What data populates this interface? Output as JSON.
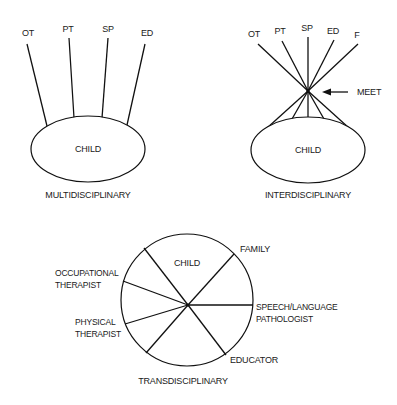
{
  "diagrams": {
    "multidisciplinary": {
      "title": "MULTIDISCIPLINARY",
      "center_label": "CHILD",
      "members": [
        {
          "label": "OT"
        },
        {
          "label": "PT"
        },
        {
          "label": "SP"
        },
        {
          "label": "ED"
        }
      ]
    },
    "interdisciplinary": {
      "title": "INTERDISCIPLINARY",
      "center_label": "CHILD",
      "meet_label": "MEET",
      "members": [
        {
          "label": "OT"
        },
        {
          "label": "PT"
        },
        {
          "label": "SP"
        },
        {
          "label": "ED"
        },
        {
          "label": "F"
        }
      ]
    },
    "transdisciplinary": {
      "title": "TRANSDISCIPLINARY",
      "segments": {
        "child": "CHILD",
        "family": "FAMILY",
        "slp_line1": "SPEECH/LANGUAGE",
        "slp_line2": "PATHOLOGIST",
        "educator": "EDUCATOR",
        "pt_line1": "PHYSICAL",
        "pt_line2": "THERAPIST",
        "ot_line1": "OCCUPATIONAL",
        "ot_line2": "THERAPIST"
      }
    }
  }
}
